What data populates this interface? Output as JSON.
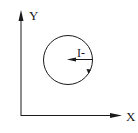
{
  "diagram": {
    "axes": {
      "y_label": "Y",
      "x_label": "X"
    },
    "circle": {
      "vector_label": "I-",
      "direction": "clockwise"
    },
    "colors": {
      "stroke": "#1a1a1a",
      "background": "#ffffff"
    }
  }
}
